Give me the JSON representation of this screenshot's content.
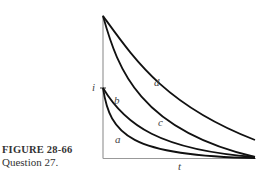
{
  "caption": {
    "figure_number": "FIGURE 28-66",
    "subtitle": "Question 27."
  },
  "axes": {
    "y_label": "i",
    "x_label": "t"
  },
  "curves": [
    {
      "label": "a",
      "start": "lower",
      "decay": "fastest"
    },
    {
      "label": "b",
      "start": "lower",
      "decay": "slower"
    },
    {
      "label": "c",
      "start": "higher",
      "decay": "faster"
    },
    {
      "label": "d",
      "start": "higher",
      "decay": "slowest"
    }
  ],
  "colors": {
    "curve": "#111111",
    "axis": "#888888",
    "text": "#333333"
  }
}
